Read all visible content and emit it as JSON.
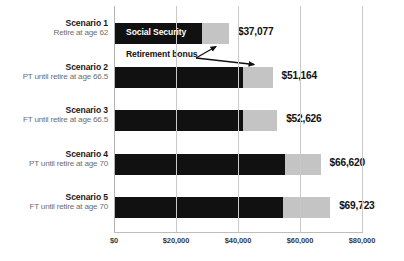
{
  "chart_data": {
    "type": "bar",
    "orientation": "horizontal",
    "stacked": true,
    "title": "",
    "subtitle": "",
    "xlabel": "",
    "ylabel": "",
    "xlim": [
      0,
      80000
    ],
    "grid": true,
    "legend_position": "in-bar",
    "categories": [
      "Scenario 1",
      "Scenario 2",
      "Scenario 3",
      "Scenario 4",
      "Scenario 5"
    ],
    "category_sublabels": [
      "Retire at age 62",
      "PT until retire at age 66.5",
      "FT until retire at age 66.5",
      "PT until retire at age 70",
      "FT until retire at age 70"
    ],
    "series": [
      {
        "name": "Social Security",
        "color": "#111111",
        "values": [
          28400,
          41600,
          41600,
          55100,
          54500
        ]
      },
      {
        "name": "Retirement bonus",
        "color": "#c4c4c4",
        "values": [
          8677,
          9564,
          11026,
          11520,
          15223
        ]
      }
    ],
    "totals": [
      37077,
      51164,
      52626,
      66620,
      69723
    ],
    "total_labels": [
      "$37,077",
      "$51,164",
      "$52,626",
      "$66,620",
      "$69,723"
    ],
    "xticks": [
      0,
      20000,
      40000,
      60000,
      80000
    ],
    "xtick_labels": [
      "$0",
      "$20,000",
      "$40,000",
      "$60,000",
      "$80,000"
    ],
    "annotations": [
      {
        "name": "social-security-series-label",
        "text": "Social Security"
      },
      {
        "name": "retirement-bonus-annotation",
        "text": "Retirement bonus"
      }
    ]
  },
  "rows": [
    {
      "title": "Scenario 1",
      "sub": "Retire at age 62",
      "base": 28400,
      "bonus": 8677,
      "total_label": "$37,077"
    },
    {
      "title": "Scenario 2",
      "sub": "PT until retire at age 66.5",
      "base": 41600,
      "bonus": 9564,
      "total_label": "$51,164"
    },
    {
      "title": "Scenario 3",
      "sub": "FT until retire at age 66.5",
      "base": 41600,
      "bonus": 11026,
      "total_label": "$52,626"
    },
    {
      "title": "Scenario 4",
      "sub": "PT until retire at age 70",
      "base": 55100,
      "bonus": 11520,
      "total_label": "$66,620"
    },
    {
      "title": "Scenario 5",
      "sub": "FT until retire at age 70",
      "base": 54500,
      "bonus": 15223,
      "total_label": "$69,723"
    }
  ],
  "labels": {
    "series_in_bar": "Social Security",
    "annotation": "Retirement bonus"
  },
  "ticks": [
    {
      "value": 0,
      "label": "$0"
    },
    {
      "value": 20000,
      "label": "$20,000"
    },
    {
      "value": 40000,
      "label": "$40,000"
    },
    {
      "value": 60000,
      "label": "$60,000"
    },
    {
      "value": 80000,
      "label": "$80,000"
    }
  ],
  "colors": {
    "base": "#111111",
    "bonus": "#c4c4c4",
    "grid": "#c9c9c9",
    "text": "#111111",
    "muted_text": "#6e6e6e",
    "background": "#ffffff"
  }
}
